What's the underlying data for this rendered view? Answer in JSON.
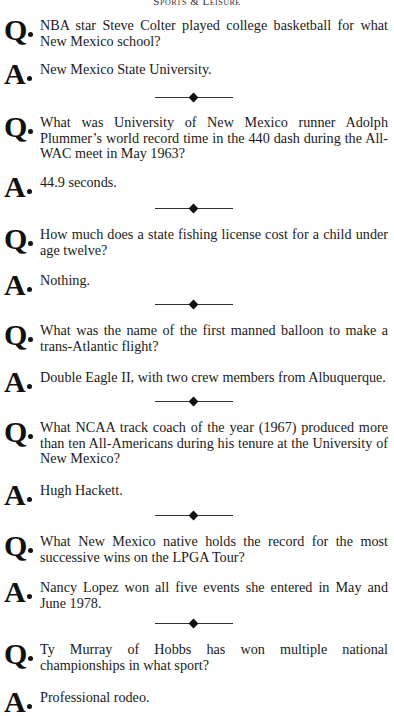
{
  "header": {
    "title": "Sports & Leisure"
  },
  "marks": {
    "question": "Q",
    "answer": "A"
  },
  "items": [
    {
      "q": "NBA star Steve Colter played college basketball for what New Mexico school?",
      "a": "New Mexico State University."
    },
    {
      "q": "What was University of New Mexico runner Adolph Plummer’s world record time in the 440 dash during the All-WAC meet in May 1963?",
      "a": "44.9 seconds."
    },
    {
      "q": "How much does a state fishing license cost for a child under age twelve?",
      "a": "Nothing."
    },
    {
      "q": "What was the name of the first manned balloon to make a trans-Atlantic flight?",
      "a": "Double Eagle II, with two crew members from Albuquerque."
    },
    {
      "q": "What NCAA track coach of the year (1967) produced more than ten All-Americans during his tenure at the University of New Mexico?",
      "a": "Hugh Hackett."
    },
    {
      "q": "What New Mexico native holds the record for the most successive wins on the LPGA Tour?",
      "a": "Nancy Lopez won all five events she entered in May and June 1978."
    },
    {
      "q": "Ty Murray of Hobbs has won multiple national championships in what sport?",
      "a": "Professional rodeo."
    }
  ]
}
